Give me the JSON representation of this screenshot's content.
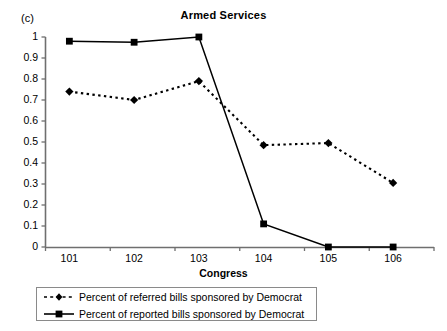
{
  "panel_label": "(c)",
  "chart_data": {
    "type": "line",
    "title": "Armed Services",
    "xlabel": "Congress",
    "ylabel": "",
    "categories": [
      "101",
      "102",
      "103",
      "104",
      "105",
      "106"
    ],
    "ylim": [
      0,
      1
    ],
    "ytick_labels": [
      "0",
      "0.1",
      "0.2",
      "0.3",
      "0.4",
      "0.5",
      "0.6",
      "0.7",
      "0.8",
      "0.9",
      "1"
    ],
    "ytick_values": [
      0,
      0.1,
      0.2,
      0.3,
      0.4,
      0.5,
      0.6,
      0.7,
      0.8,
      0.9,
      1
    ],
    "grid": false,
    "legend_position": "bottom",
    "series": [
      {
        "name": "Percent of referred bills sponsored by Democrat",
        "marker": "diamond",
        "line_style": "dotted",
        "color": "#000000",
        "values": [
          0.74,
          0.7,
          0.79,
          0.485,
          0.495,
          0.305
        ]
      },
      {
        "name": "Percent of reported bills sponsored by Democrat",
        "marker": "square",
        "line_style": "solid",
        "color": "#000000",
        "values": [
          0.98,
          0.975,
          1.0,
          0.11,
          0.0,
          0.0
        ]
      }
    ]
  }
}
